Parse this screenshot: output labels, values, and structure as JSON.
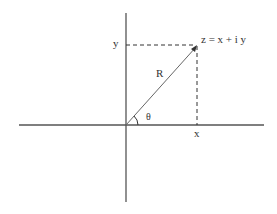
{
  "diagram": {
    "labels": {
      "point": "z = x + i y",
      "y_axis_value": "y",
      "x_axis_value": "x",
      "radius": "R",
      "angle": "θ"
    },
    "colors": {
      "axis": "#555555",
      "vector": "#666666",
      "dashed": "#333333",
      "text": "#333333",
      "background": "#ffffff"
    }
  }
}
